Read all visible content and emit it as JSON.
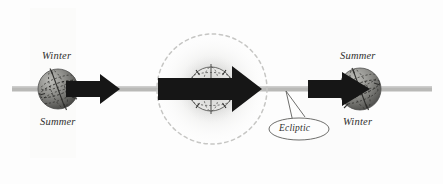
{
  "figure": {
    "kind": "astronomy-diagram",
    "title_text": "",
    "background_color": "#fdfdfd",
    "ecliptic_line_color": "#b9b9b7",
    "arrow_color": "#161616",
    "globe_dark_color": "#4a4a48",
    "globe_light_color": "#b5b5b1",
    "sun_glow_color": "#d8d8d6",
    "sun_dash_color": "#c9c9c7",
    "callout_outline_color": "#6e6e6c",
    "label_color": "#30302e"
  },
  "labels": {
    "left_top": "Winter",
    "left_bottom": "Summer",
    "right_top": "Summer",
    "right_bottom": "Winter",
    "callout": "Ecliptic"
  },
  "objects": {
    "left_earth": {
      "name": "earth-winter-solstice",
      "cx": 58,
      "cy": 89,
      "r": 20
    },
    "sun": {
      "name": "sun",
      "cx": 212,
      "cy": 89,
      "r": 55
    },
    "center_earth": {
      "name": "earth-outline",
      "cx": 211,
      "cy": 89,
      "r": 22
    },
    "right_earth": {
      "name": "earth-summer-solstice",
      "cx": 360,
      "cy": 89,
      "r": 21
    },
    "ecliptic_line": {
      "y": 89,
      "x_start": 12,
      "x_end": 432
    }
  },
  "arrows": [
    {
      "name": "left-rotation-arrow",
      "x": 66,
      "y": 89,
      "length": 54
    },
    {
      "name": "center-rotation-arrow",
      "x": 158,
      "y": 89,
      "length": 104
    },
    {
      "name": "right-rotation-arrow",
      "x": 308,
      "y": 89,
      "length": 62
    }
  ]
}
